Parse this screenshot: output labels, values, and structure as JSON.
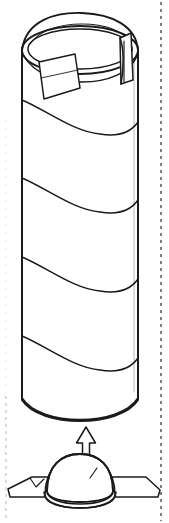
{
  "figure": {
    "title": "Cylindrical container with dome base",
    "kind": "patent-line-drawing",
    "width_px": 169,
    "height_px": 523,
    "background_color": "#ffffff",
    "ink_color": "#1a1a1a",
    "crop_mark_color": "#2b2b2b"
  },
  "canvas": {
    "view_box": "0 0 169 523"
  },
  "container": {
    "name": "spiral-wound-cylinder",
    "left_edge_x": 22,
    "right_edge_x": 138,
    "top_y": 14,
    "bottom_y": 422,
    "rim": {
      "outer_ellipse": {
        "cx": 80,
        "cy": 48,
        "rx": 58,
        "ry": 26
      },
      "inner_ellipse": {
        "cx": 80,
        "cy": 46,
        "rx": 52,
        "ry": 22
      },
      "dome_top_cap": true,
      "notch_side": "right"
    },
    "tab": {
      "name": "pull-tab-label",
      "position": "front-left",
      "shape": "quadrilateral"
    },
    "bands": {
      "count": 4,
      "style": "helical-wrap",
      "baseline_y": [
        100,
        178,
        257,
        336
      ],
      "drop_px": 34
    }
  },
  "base_assembly": {
    "name": "dome-base-unit",
    "dome": {
      "cx": 80,
      "base_y": 503,
      "rx": 35,
      "ry": 32,
      "double_outline": true
    },
    "flange_left": {
      "outer_x": 8,
      "inner_x": 50
    },
    "flange_right": {
      "outer_x": 160,
      "inner_x": 112
    },
    "tick_marks": 2
  },
  "arrow": {
    "name": "assembly-direction-arrow",
    "direction": "up",
    "tip_y": 427,
    "tail_y": 468,
    "center_x": 86,
    "shaft_width": 7,
    "head_width": 19
  },
  "crop_marks": {
    "right": {
      "x": 161,
      "from_y": 2,
      "to_y": 521,
      "visible": true
    },
    "left": {
      "x": 6,
      "from_y": 396,
      "to_y": 521,
      "visible": true,
      "faint": true
    },
    "dash": "3 4"
  }
}
